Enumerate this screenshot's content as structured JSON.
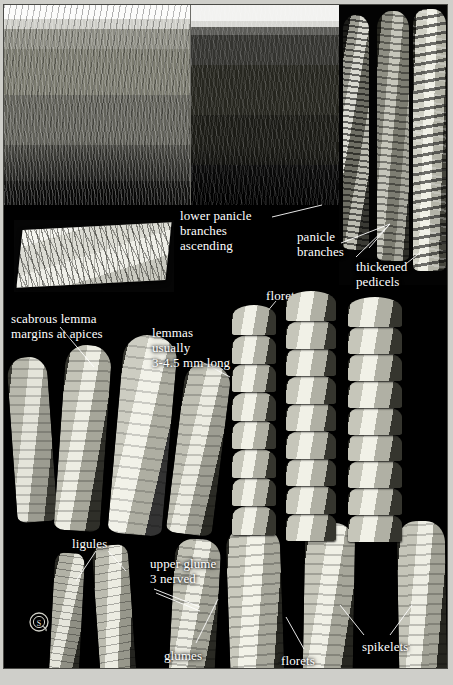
{
  "plate": {
    "background_color": "#000000",
    "label_color": "#ffffff",
    "frame_color": "#4a4a46",
    "paper_color": "#cfcfca"
  },
  "labels": [
    {
      "id": "lower-panicle-branches-ascending",
      "text": "lower panicle\nbranches\nascending",
      "x": 176,
      "y": 203
    },
    {
      "id": "panicle-branches",
      "text": "panicle\nbranches",
      "x": 293,
      "y": 224
    },
    {
      "id": "thickened-pedicels",
      "text": "thickened\npedicels",
      "x": 352,
      "y": 254
    },
    {
      "id": "florets-upper",
      "text": "florets",
      "x": 262,
      "y": 283
    },
    {
      "id": "scabrous-lemma-margins",
      "text": "scabrous lemma\nmargins at apices",
      "x": 7,
      "y": 306
    },
    {
      "id": "lemmas-length",
      "text": "lemmas\nusually\n3-4.5 mm long",
      "x": 148,
      "y": 320
    },
    {
      "id": "ligules",
      "text": "ligules",
      "x": 68,
      "y": 531
    },
    {
      "id": "upper-glume-3-nerved",
      "text": "upper glume\n3 nerved",
      "x": 146,
      "y": 551
    },
    {
      "id": "glumes",
      "text": "glumes",
      "x": 160,
      "y": 643
    },
    {
      "id": "florets-lower",
      "text": "florets",
      "x": 277,
      "y": 648
    },
    {
      "id": "spikelets",
      "text": "spikelets",
      "x": 358,
      "y": 634
    }
  ],
  "leaders": [
    {
      "id": "leader-lower-panicle",
      "points": "268,212 318,200"
    },
    {
      "id": "leader-panicle-branches-a",
      "points": "337,238 386,219"
    },
    {
      "id": "leader-panicle-branches-b",
      "points": "386,219 352,252"
    },
    {
      "id": "leader-panicle-branches-c",
      "points": "386,219 365,243"
    },
    {
      "id": "leader-thickened-pedicels",
      "points": "398,262 418,246"
    },
    {
      "id": "leader-florets-upper-a",
      "points": "272,296 252,320"
    },
    {
      "id": "leader-florets-upper-b",
      "points": "292,296 318,318"
    },
    {
      "id": "leader-scabrous-a",
      "points": "56,322 90,362"
    },
    {
      "id": "leader-lemmas-a",
      "points": "196,356 226,372"
    },
    {
      "id": "leader-ligules-a",
      "points": "92,546 72,576"
    },
    {
      "id": "leader-ligules-b",
      "points": "104,546 122,566"
    },
    {
      "id": "leader-upper-glume-a",
      "points": "150,584 196,602"
    },
    {
      "id": "leader-upper-glume-b",
      "points": "152,588 196,606"
    },
    {
      "id": "leader-glumes",
      "points": "192,638 214,594"
    },
    {
      "id": "leader-florets-lower",
      "points": "300,644 282,612"
    },
    {
      "id": "leader-spikelets-a",
      "points": "360,630 336,600"
    },
    {
      "id": "leader-spikelets-b",
      "points": "386,630 408,600"
    }
  ],
  "panels": [
    {
      "id": "photo-landscape-far",
      "caption": "grassland-habitat-distant"
    },
    {
      "id": "photo-landscape-inset",
      "caption": "grassland-habitat-closeup"
    },
    {
      "id": "photo-panicles",
      "caption": "panicle-specimens"
    },
    {
      "id": "photo-herbarium",
      "caption": "pressed-specimen-bundle"
    }
  ],
  "logo": {
    "name": "copyright-stamp-logo",
    "glyph": "S"
  }
}
